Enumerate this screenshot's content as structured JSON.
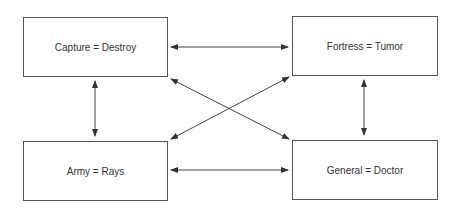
{
  "diagram": {
    "boxes": [
      {
        "id": "capture",
        "label": "Capture = Destroy"
      },
      {
        "id": "fortress",
        "label": "Fortress = Tumor"
      },
      {
        "id": "army",
        "label": "Army = Rays"
      },
      {
        "id": "general",
        "label": "General = Doctor"
      }
    ],
    "connections": [
      {
        "from": "Capture = Destroy",
        "to": "Fortress = Tumor",
        "type": "bidirectional"
      },
      {
        "from": "Capture = Destroy",
        "to": "Army = Rays",
        "type": "bidirectional"
      },
      {
        "from": "Capture = Destroy",
        "to": "General = Doctor",
        "type": "bidirectional"
      },
      {
        "from": "Fortress = Tumor",
        "to": "Army = Rays",
        "type": "bidirectional"
      },
      {
        "from": "Fortress = Tumor",
        "to": "General = Doctor",
        "type": "bidirectional"
      },
      {
        "from": "Army = Rays",
        "to": "General = Doctor",
        "type": "bidirectional"
      }
    ],
    "colors": {
      "line": "#444444",
      "border": "#555555",
      "text": "#333333"
    }
  }
}
